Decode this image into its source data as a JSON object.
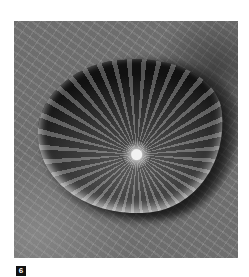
{
  "figure": {
    "label": "6",
    "image_subject": "water drop on leaf surface",
    "label_bg_color": "#111111",
    "label_text_color": "#ffffff"
  }
}
